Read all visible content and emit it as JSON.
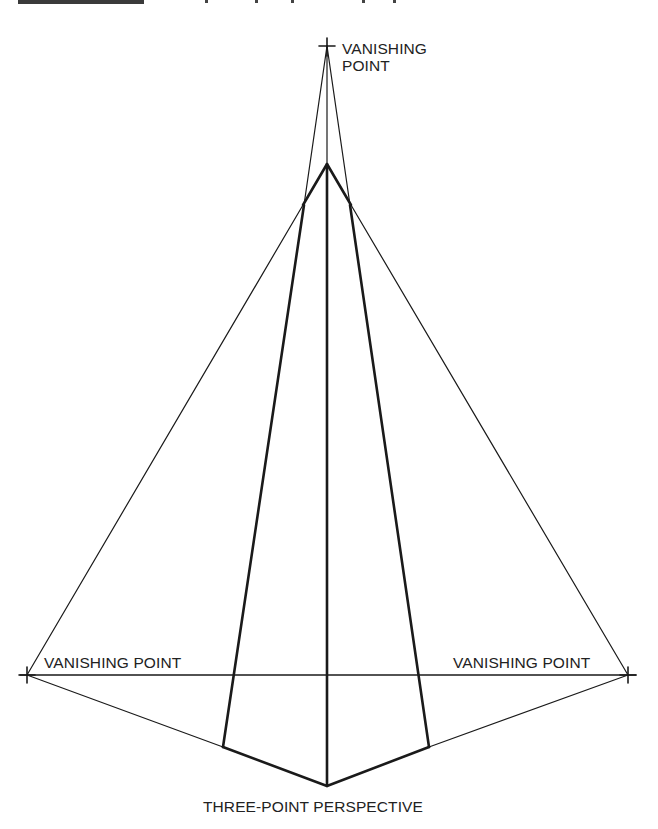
{
  "figure": {
    "caption": "THREE-POINT PERSPECTIVE",
    "labels": {
      "top_line1": "VANISHING",
      "top_line2": "POINT",
      "left": "VANISHING POINT",
      "right": "VANISHING POINT"
    },
    "colors": {
      "line": "#1a1a1a",
      "text": "#222222",
      "background": "#ffffff"
    }
  }
}
